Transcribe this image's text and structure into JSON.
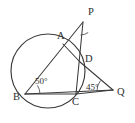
{
  "diagram": {
    "type": "euclidean-geometry",
    "colors": {
      "stroke": "#3a3a3a",
      "arc_stroke": "#4a4a4a",
      "label_fill": "#2e2e2e",
      "background": "#ffffff"
    },
    "circle": {
      "center_x": 48,
      "center_y": 71,
      "radius": 37
    },
    "points": [
      {
        "id": "P",
        "label": "P",
        "x": 83,
        "y": 22,
        "label_x": 88,
        "label_y": 15
      },
      {
        "id": "A",
        "label": "A",
        "x": 63,
        "y": 44,
        "label_x": 57,
        "label_y": 39
      },
      {
        "id": "D",
        "label": "D",
        "x": 80,
        "y": 62,
        "label_x": 85,
        "label_y": 62
      },
      {
        "id": "Q",
        "label": "Q",
        "x": 113,
        "y": 90,
        "label_x": 117,
        "label_y": 95
      },
      {
        "id": "C",
        "label": "C",
        "x": 76,
        "y": 94,
        "label_x": 76,
        "label_y": 104
      },
      {
        "id": "B",
        "label": "B",
        "x": 25,
        "y": 94,
        "label_x": 14,
        "label_y": 100
      }
    ],
    "segments": [
      {
        "name": "B-to-P",
        "from": "B",
        "to": "P"
      },
      {
        "name": "B-to-Q",
        "from": "B",
        "to": "Q"
      },
      {
        "name": "B-to-C",
        "from": "B",
        "to": "C"
      },
      {
        "name": "A-to-D",
        "from": "A",
        "to": "D"
      },
      {
        "name": "P-to-C",
        "from": "P",
        "to": "C"
      },
      {
        "name": "D-to-Q",
        "from": "D",
        "to": "Q"
      },
      {
        "name": "C-to-Q",
        "from": "C",
        "to": "Q"
      }
    ],
    "angles": [
      {
        "id": "angle-B",
        "vertex": "B",
        "value": "50",
        "label": "50°",
        "label_x": 35,
        "label_y": 83
      },
      {
        "id": "angle-Q",
        "vertex": "Q",
        "value": "45",
        "label": "45°",
        "label_x": 88,
        "label_y": 89
      },
      {
        "id": "angle-P",
        "vertex": "P",
        "value": "",
        "label": "",
        "label_x": 0,
        "label_y": 0
      }
    ]
  }
}
